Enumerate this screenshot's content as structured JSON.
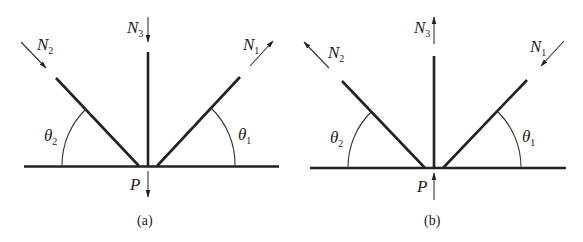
{
  "figure": {
    "colors": {
      "line": "#222222",
      "background": "#ffffff"
    }
  },
  "panels": [
    {
      "caption": "(a)",
      "labels": {
        "n1": "N",
        "n1_sub": "1",
        "n2": "N",
        "n2_sub": "2",
        "n3": "N",
        "n3_sub": "3",
        "theta1": "θ",
        "theta1_sub": "1",
        "theta2": "θ",
        "theta2_sub": "2",
        "p": "P"
      },
      "arrows": {
        "n1": "away-from-joint",
        "n2": "toward-joint",
        "n3": "toward-joint",
        "p": "down"
      }
    },
    {
      "caption": "(b)",
      "labels": {
        "n1": "N",
        "n1_sub": "1",
        "n2": "N",
        "n2_sub": "2",
        "n3": "N",
        "n3_sub": "3",
        "theta1": "θ",
        "theta1_sub": "1",
        "theta2": "θ",
        "theta2_sub": "2",
        "p": "P"
      },
      "arrows": {
        "n1": "toward-joint",
        "n2": "away-from-joint",
        "n3": "away-from-joint",
        "p": "up"
      }
    }
  ]
}
